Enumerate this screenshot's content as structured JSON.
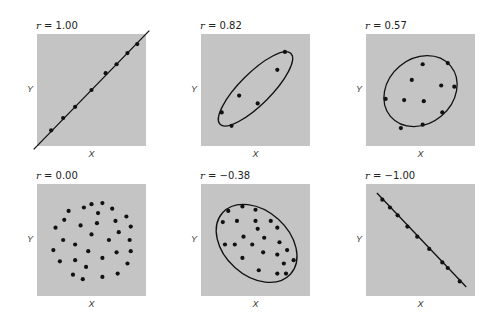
{
  "chart_data": [
    {
      "type": "scatter",
      "title": "r = 1.00",
      "r_label": "r = 1.00",
      "xlabel": "X",
      "ylabel": "Y",
      "grid": false,
      "overlay": "line",
      "line": [
        [
          0,
          100
        ],
        [
          100,
          0
        ]
      ],
      "points": [
        [
          13,
          86
        ],
        [
          24,
          75
        ],
        [
          35,
          65
        ],
        [
          50,
          50
        ],
        [
          63,
          35
        ],
        [
          73,
          27
        ],
        [
          83,
          17
        ],
        [
          92,
          9
        ]
      ]
    },
    {
      "type": "scatter",
      "title": "r = 0.82",
      "r_label": "r = 0.82",
      "xlabel": "X",
      "ylabel": "Y",
      "grid": false,
      "overlay": "ellipse",
      "ellipse": {
        "cx": 50,
        "cy": 49,
        "rx": 46,
        "ry": 14,
        "rotate": -45
      },
      "points": [
        [
          77,
          16
        ],
        [
          70,
          32
        ],
        [
          35,
          55
        ],
        [
          52,
          62
        ],
        [
          19,
          70
        ],
        [
          28,
          82
        ]
      ]
    },
    {
      "type": "scatter",
      "title": "r = 0.57",
      "r_label": "r = 0.57",
      "xlabel": "X",
      "ylabel": "Y",
      "grid": false,
      "overlay": "ellipse",
      "ellipse": {
        "cx": 50,
        "cy": 51,
        "rx": 36,
        "ry": 29,
        "rotate": -40
      },
      "points": [
        [
          52,
          27
        ],
        [
          75,
          26
        ],
        [
          42,
          41
        ],
        [
          69,
          46
        ],
        [
          81,
          47
        ],
        [
          18,
          58
        ],
        [
          35,
          59
        ],
        [
          53,
          60
        ],
        [
          70,
          70
        ],
        [
          32,
          84
        ],
        [
          52,
          81
        ]
      ]
    },
    {
      "type": "scatter",
      "title": "r = 0.00",
      "r_label": "r = 0.00",
      "xlabel": "X",
      "ylabel": "Y",
      "grid": false,
      "overlay": "none",
      "points": [
        [
          29,
          24
        ],
        [
          43,
          21
        ],
        [
          50,
          18
        ],
        [
          60,
          17
        ],
        [
          69,
          22
        ],
        [
          56,
          26
        ],
        [
          25,
          32
        ],
        [
          40,
          37
        ],
        [
          55,
          35
        ],
        [
          72,
          33
        ],
        [
          82,
          29
        ],
        [
          86,
          38
        ],
        [
          17,
          39
        ],
        [
          75,
          43
        ],
        [
          50,
          45
        ],
        [
          24,
          50
        ],
        [
          66,
          50
        ],
        [
          85,
          50
        ],
        [
          35,
          54
        ],
        [
          15,
          59
        ],
        [
          47,
          60
        ],
        [
          73,
          61
        ],
        [
          86,
          60
        ],
        [
          60,
          66
        ],
        [
          21,
          69
        ],
        [
          35,
          68
        ],
        [
          83,
          71
        ],
        [
          45,
          74
        ],
        [
          33,
          81
        ],
        [
          74,
          80
        ],
        [
          42,
          85
        ],
        [
          60,
          83
        ]
      ]
    },
    {
      "type": "scatter",
      "title": "r = −0.38",
      "r_label": "r = −0.38",
      "xlabel": "X",
      "ylabel": "Y",
      "grid": false,
      "overlay": "ellipse",
      "ellipse": {
        "cx": 51,
        "cy": 53,
        "rx": 42,
        "ry": 29,
        "rotate": 42
      },
      "points": [
        [
          25,
          24
        ],
        [
          38,
          20
        ],
        [
          50,
          23
        ],
        [
          20,
          34
        ],
        [
          33,
          33
        ],
        [
          50,
          33
        ],
        [
          64,
          33
        ],
        [
          52,
          40
        ],
        [
          70,
          39
        ],
        [
          39,
          47
        ],
        [
          58,
          48
        ],
        [
          72,
          52
        ],
        [
          22,
          54
        ],
        [
          31,
          54
        ],
        [
          47,
          54
        ],
        [
          57,
          61
        ],
        [
          70,
          63
        ],
        [
          79,
          59
        ],
        [
          38,
          66
        ],
        [
          76,
          71
        ],
        [
          85,
          68
        ],
        [
          53,
          77
        ],
        [
          70,
          80
        ],
        [
          78,
          80
        ]
      ]
    },
    {
      "type": "scatter",
      "title": "r = −1.00",
      "r_label": "r = −1.00",
      "xlabel": "X",
      "ylabel": "Y",
      "grid": false,
      "overlay": "line",
      "line": [
        [
          10,
          8
        ],
        [
          92,
          92
        ]
      ],
      "points": [
        [
          15,
          14
        ],
        [
          22,
          21
        ],
        [
          29,
          28
        ],
        [
          38,
          38
        ],
        [
          47,
          47
        ],
        [
          58,
          58
        ],
        [
          70,
          70
        ],
        [
          75,
          75
        ],
        [
          86,
          87
        ]
      ]
    }
  ],
  "labels": {
    "panels": [
      {
        "r": "1.00"
      },
      {
        "r": "0.82"
      },
      {
        "r": "0.57"
      },
      {
        "r": "0.00"
      },
      {
        "r": "−0.38"
      },
      {
        "r": "−1.00"
      }
    ],
    "r_symbol": "r",
    "equals": " = ",
    "x_axis": "X",
    "y_axis": "Y"
  },
  "colors": {
    "plot_bg": "#c4c4c4",
    "ink": "#111111"
  }
}
